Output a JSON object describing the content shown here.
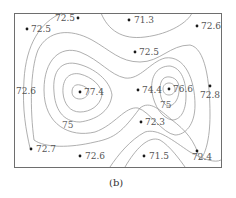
{
  "figure": {
    "caption": "(b)",
    "colors": {
      "frame": "#6e6e6e",
      "contour": "#9a9a9a",
      "point": "#1a1a1a",
      "text": "#555555"
    }
  },
  "points": [
    {
      "value": "72.5",
      "x": 78,
      "y": 18,
      "lx": 55,
      "ly": 21
    },
    {
      "value": "72.5",
      "x": 27,
      "y": 29,
      "lx": 31,
      "ly": 32
    },
    {
      "value": "71.3",
      "x": 129,
      "y": 20,
      "lx": 134,
      "ly": 23
    },
    {
      "value": "72.6",
      "x": 197,
      "y": 26,
      "lx": 201,
      "ly": 29
    },
    {
      "value": "72.5",
      "x": 135,
      "y": 52,
      "lx": 139,
      "ly": 55
    },
    {
      "value": "77.4",
      "x": 80,
      "y": 92,
      "lx": 84,
      "ly": 95
    },
    {
      "value": "74.4",
      "x": 138,
      "y": 90,
      "lx": 142,
      "ly": 93
    },
    {
      "value": "76.6",
      "x": 169,
      "y": 89,
      "lx": 173,
      "ly": 92
    },
    {
      "value": "72.8",
      "x": 210,
      "y": 86,
      "lx": 200,
      "ly": 98
    },
    {
      "value": "72.3",
      "x": 141,
      "y": 122,
      "lx": 145,
      "ly": 125
    },
    {
      "value": "72.7",
      "x": 31,
      "y": 149,
      "lx": 36,
      "ly": 152
    },
    {
      "value": "72.6",
      "x": 80,
      "y": 156,
      "lx": 85,
      "ly": 159
    },
    {
      "value": "71.5",
      "x": 144,
      "y": 156,
      "lx": 149,
      "ly": 159
    },
    {
      "value": "72.4",
      "x": 197,
      "y": 151,
      "lx": 192,
      "ly": 160
    }
  ],
  "edge_labels": [
    {
      "value": "72.6",
      "x": 16,
      "y": 94
    }
  ],
  "contour_labels": [
    {
      "value": "75",
      "x": 62,
      "y": 128
    },
    {
      "value": "75",
      "x": 160,
      "y": 108
    }
  ]
}
